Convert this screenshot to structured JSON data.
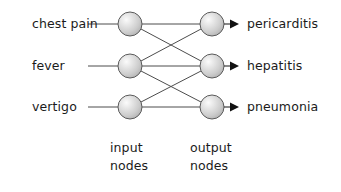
{
  "diagram": {
    "type": "bipartite-network",
    "background_color": "#ffffff",
    "node_fill_color": "#d4d4d4",
    "node_highlight_color": "#f7f7f7",
    "node_outline_color": "#5a5a5a",
    "edge_color": "#4d4d4d",
    "arrow_color": "#111111",
    "text_color": "#1b1b1b",
    "input_layer": {
      "caption_line1": "input",
      "caption_line2": "nodes",
      "nodes": [
        {
          "label": "chest pain",
          "cx": 130,
          "cy": 24
        },
        {
          "label": "fever",
          "cx": 130,
          "cy": 66
        },
        {
          "label": "vertigo",
          "cx": 130,
          "cy": 107
        }
      ]
    },
    "output_layer": {
      "caption_line1": "output",
      "caption_line2": "nodes",
      "nodes": [
        {
          "label": "pericarditis",
          "cx": 212,
          "cy": 24
        },
        {
          "label": "hepatitis",
          "cx": 212,
          "cy": 66
        },
        {
          "label": "pneumonia",
          "cx": 212,
          "cy": 107
        }
      ]
    },
    "connections": [
      {
        "from": "chest pain",
        "to": "pericarditis"
      },
      {
        "from": "chest pain",
        "to": "hepatitis"
      },
      {
        "from": "fever",
        "to": "pericarditis"
      },
      {
        "from": "fever",
        "to": "hepatitis"
      },
      {
        "from": "fever",
        "to": "pneumonia"
      },
      {
        "from": "vertigo",
        "to": "hepatitis"
      },
      {
        "from": "vertigo",
        "to": "pneumonia"
      }
    ],
    "input_stub_lines": [
      {
        "x1": 88,
        "y1": 24,
        "x2": 118,
        "y2": 24
      },
      {
        "x1": 88,
        "y1": 66,
        "x2": 118,
        "y2": 66
      },
      {
        "x1": 88,
        "y1": 107,
        "x2": 118,
        "y2": 107
      }
    ],
    "output_arrows": [
      {
        "x1": 224,
        "y1": 24,
        "x2": 231,
        "y2": 24
      },
      {
        "x1": 224,
        "y1": 66,
        "x2": 231,
        "y2": 66
      },
      {
        "x1": 224,
        "y1": 107,
        "x2": 231,
        "y2": 107
      }
    ]
  }
}
